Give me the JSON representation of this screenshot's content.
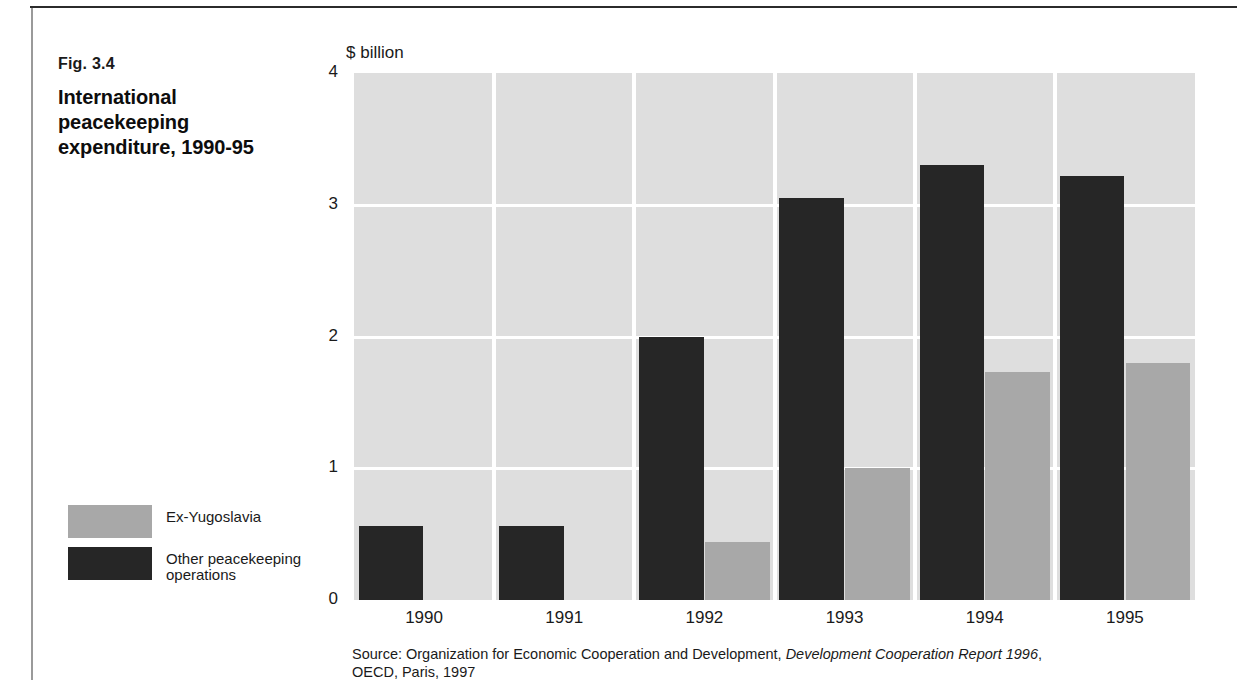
{
  "figure": {
    "number": "Fig. 3.4",
    "title": "International peacekeeping expenditure, 1990-95"
  },
  "legend": {
    "items": [
      {
        "label": "Ex-Yugoslavia",
        "color": "#a8a8a8",
        "swatch_name": "legend-swatch-ex-yugoslavia"
      },
      {
        "label": "Other peacekeeping\noperations",
        "color": "#262626",
        "swatch_name": "legend-swatch-other-operations"
      }
    ]
  },
  "source": {
    "prefix": "Source:  Organization for Economic Cooperation and Development, ",
    "italic": "Development Cooperation Report 1996",
    "suffix": ",",
    "line2": "OECD, Paris, 1997"
  },
  "chart_data": {
    "type": "bar",
    "title": "International peacekeeping expenditure, 1990-95",
    "subtitle": "",
    "unit_label": "$ billion",
    "xlabel": "",
    "ylabel": "$ billion",
    "ylim": [
      0,
      4
    ],
    "yticks": [
      "0",
      "1",
      "2",
      "3",
      "4"
    ],
    "ytick_values": [
      0,
      1,
      2,
      3,
      4
    ],
    "grid": "horizontal-white-lines",
    "legend_position": "left-outside",
    "grouping": "side-by-side (Other peacekeeping operations left, Ex-Yugoslavia right)",
    "categories": [
      "1990",
      "1991",
      "1992",
      "1993",
      "1994",
      "1995"
    ],
    "series": [
      {
        "name": "Other peacekeeping operations",
        "color": "#262626",
        "values": [
          0.56,
          0.56,
          2.0,
          3.05,
          3.3,
          3.22
        ]
      },
      {
        "name": "Ex-Yugoslavia",
        "color": "#a8a8a8",
        "values": [
          0,
          0,
          0.44,
          1.0,
          1.73,
          1.8
        ]
      }
    ],
    "plot_background": "#dedede"
  }
}
